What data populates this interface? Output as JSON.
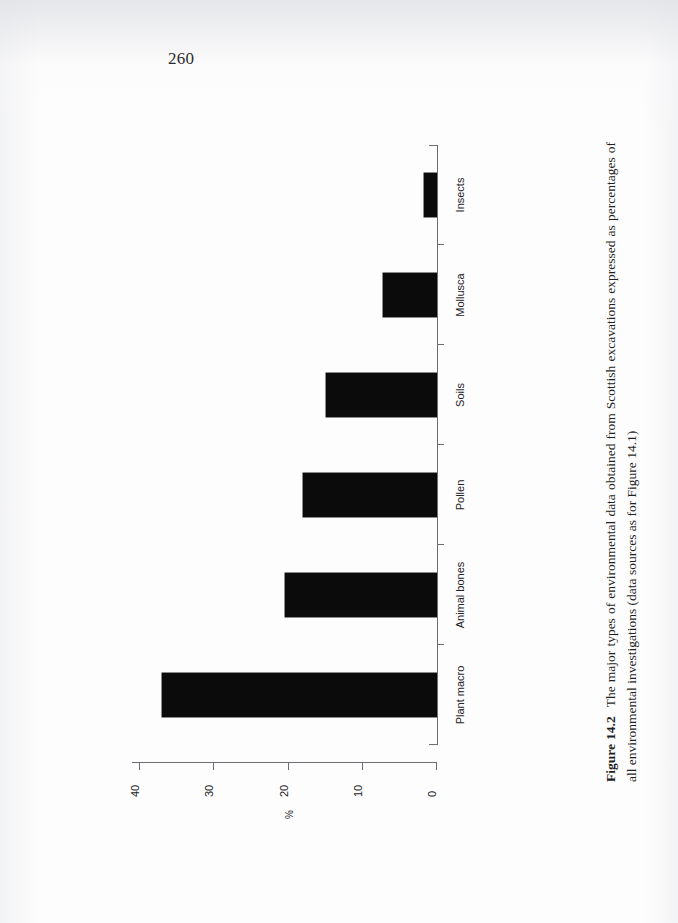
{
  "page": {
    "number": "260"
  },
  "caption": {
    "label": "Figure 14.2",
    "text": "The major types of environmental data obtained from Scottish excavations expressed as percentages of all environmental investigations (data sources as for Figure 14.1)"
  },
  "chart_data": {
    "type": "bar",
    "orientation": "horizontal",
    "title": "",
    "categories": [
      "Plant macro",
      "Animal bones",
      "Pollen",
      "Soils",
      "Mollusca",
      "Insects"
    ],
    "values": [
      37,
      20.5,
      18,
      15,
      7.3,
      1.7
    ],
    "xlabel": "%",
    "ylabel": "",
    "xlim": [
      0,
      40
    ],
    "xticks": [
      0,
      10,
      20,
      30,
      40
    ],
    "xticklabels": [
      "0",
      "10",
      "20",
      "30",
      "40"
    ],
    "x_axis_reversed": true,
    "grid": false,
    "legend": false,
    "bar_color": "#0b0b0b",
    "axis_color": "#6c6d72"
  }
}
